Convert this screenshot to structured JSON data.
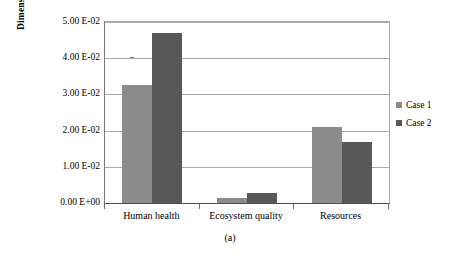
{
  "chart_data": {
    "type": "bar",
    "title": "",
    "caption": "(a)",
    "xlabel": "",
    "ylabel": "Dimensionless",
    "categories": [
      "Human health",
      "Ecosystem quality",
      "Resources"
    ],
    "series": [
      {
        "name": "Case 1",
        "color": "#8c8c8c",
        "values": [
          0.0326,
          0.0015,
          0.021
        ]
      },
      {
        "name": "Case 2",
        "color": "#585858",
        "values": [
          0.047,
          0.0027,
          0.0168
        ]
      }
    ],
    "ylim": [
      0,
      0.05
    ],
    "ytick_values": [
      0.05,
      0.04,
      0.03,
      0.02,
      0.01,
      0
    ],
    "ytick_labels": [
      "5.00 E-02",
      "4.00 E-02",
      "3.00 E-02",
      "2.00 E-02",
      "1.00 E-02",
      "0.00 E+00"
    ],
    "grid": true,
    "legend_position": "right"
  }
}
